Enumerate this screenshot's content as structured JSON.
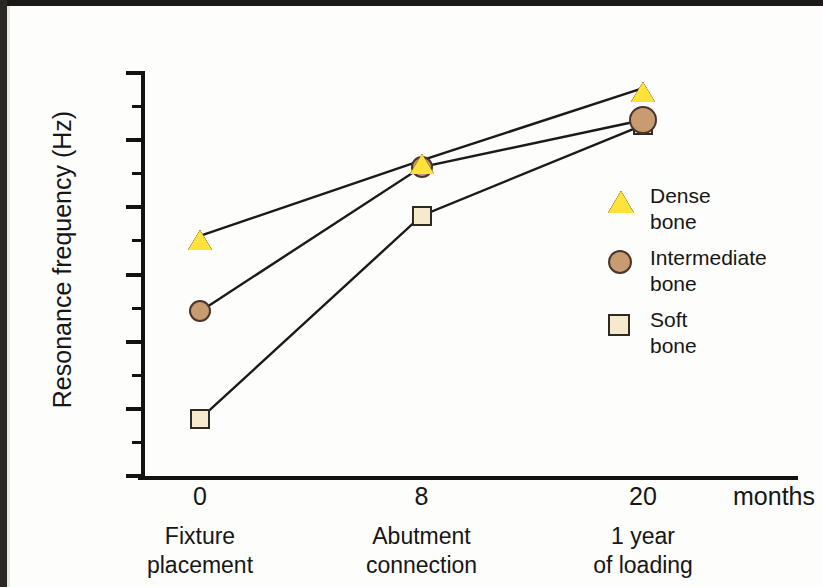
{
  "chart_data": {
    "type": "line",
    "title": "",
    "xlabel": "months",
    "ylabel": "Resonance frequency (Hz)",
    "ylim": [
      7000,
      8200
    ],
    "ytick_step": 200,
    "yminor_step": 100,
    "grid": false,
    "legend_position": "right",
    "x": [
      0,
      8,
      20
    ],
    "categories": [
      "0",
      "8",
      "20"
    ],
    "category_descriptions": [
      [
        "Fixture",
        "placement"
      ],
      [
        "Abutment",
        "connection"
      ],
      [
        "1 year",
        "of loading"
      ]
    ],
    "ytick_labels": [
      "8200",
      "8000",
      "7800",
      "7600",
      "7400",
      "7200",
      "7000"
    ],
    "ytick_values": [
      8200,
      8000,
      7800,
      7600,
      7400,
      7200,
      7000
    ],
    "series": [
      {
        "name": "Dense bone",
        "label_lines": [
          "Dense",
          "bone"
        ],
        "marker": "triangle",
        "fill": "#FFE23A",
        "stroke": "#3a3018",
        "values": [
          7715,
          7940,
          8155
        ]
      },
      {
        "name": "Intermediate bone",
        "label_lines": [
          "Intermediate",
          "bone"
        ],
        "marker": "circle",
        "fill": "#C99B70",
        "stroke": "#4a352a",
        "values": [
          7490,
          7920,
          8060
        ]
      },
      {
        "name": "Soft bone",
        "label_lines": [
          "Soft",
          "bone"
        ],
        "marker": "square",
        "fill": "#F7E9CE",
        "stroke": "#2e2a22",
        "values": [
          7170,
          7775,
          8045
        ]
      }
    ],
    "line_color": "#1a1a1a"
  },
  "axis": {
    "y_title": "Resonance frequency (Hz)",
    "x_unit": "months"
  }
}
